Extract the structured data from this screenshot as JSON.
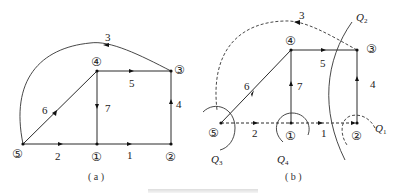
{
  "graph_a": {
    "caption": "( a )",
    "nodes": [
      {
        "id": "1",
        "label": "①",
        "x": 97,
        "y": 144
      },
      {
        "id": "2",
        "label": "②",
        "x": 171,
        "y": 144
      },
      {
        "id": "3",
        "label": "③",
        "x": 171,
        "y": 71
      },
      {
        "id": "4",
        "label": "④",
        "x": 97,
        "y": 71
      },
      {
        "id": "5",
        "label": "⑤",
        "x": 23,
        "y": 144
      }
    ],
    "edges": [
      {
        "label": "1",
        "from": "1",
        "to": "2"
      },
      {
        "label": "2",
        "from": "5",
        "to": "1"
      },
      {
        "label": "3",
        "from": "3",
        "to": "5"
      },
      {
        "label": "4",
        "from": "2",
        "to": "3"
      },
      {
        "label": "5",
        "from": "4",
        "to": "3"
      },
      {
        "label": "6",
        "from": "5",
        "to": "4"
      },
      {
        "label": "7",
        "from": "4",
        "to": "1"
      }
    ]
  },
  "graph_b": {
    "caption": "( b )",
    "nodes": [
      {
        "id": "1",
        "label": "①",
        "x": 291,
        "y": 123
      },
      {
        "id": "2",
        "label": "②",
        "x": 357,
        "y": 123
      },
      {
        "id": "3",
        "label": "③",
        "x": 357,
        "y": 50
      },
      {
        "id": "4",
        "label": "④",
        "x": 291,
        "y": 50
      },
      {
        "id": "5",
        "label": "⑤",
        "x": 221,
        "y": 123
      }
    ],
    "tree_edges": [
      "4",
      "5",
      "6",
      "7"
    ],
    "link_edges": [
      "1",
      "2",
      "3"
    ],
    "edge_labels": {
      "e1": "1",
      "e2": "2",
      "e3": "3",
      "e4": "4",
      "e5": "5",
      "e6": "6",
      "e7": "7"
    },
    "cutsets": [
      {
        "name": "Q",
        "sub": "1"
      },
      {
        "name": "Q",
        "sub": "2"
      },
      {
        "name": "Q",
        "sub": "3"
      },
      {
        "name": "Q",
        "sub": "4"
      }
    ]
  },
  "figure_caption": ""
}
